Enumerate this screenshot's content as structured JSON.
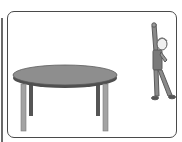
{
  "scene": {
    "description": "Illustration of a round table and a person stretching one arm upward",
    "objects": [
      {
        "name": "round-table",
        "label": "table"
      },
      {
        "name": "person",
        "label": "person reaching up"
      }
    ],
    "colors": {
      "frame": "#4a4a4a",
      "table_top": "#8e8e8e",
      "table_rim": "#4f4f4f",
      "front_legs": "#a3a3a3",
      "back_legs": "#555555",
      "person": "#6b6b6b"
    }
  }
}
